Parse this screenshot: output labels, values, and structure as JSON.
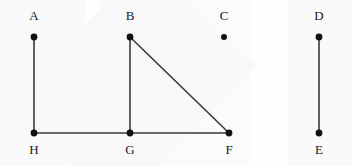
{
  "figure": {
    "kind": "undirected-graph-diagram",
    "width": 352,
    "height": 166,
    "background_color": "#fdfdfd",
    "edge_color": "#3a3a3a",
    "vertex_color": "#111111",
    "label_color": "#1a1a1a"
  },
  "vertices": [
    {
      "id": "A",
      "label": "A",
      "x": 34,
      "y": 37,
      "label_x": 24,
      "label_y": 9,
      "label_position": "above",
      "degree": 1,
      "radius": 3.4
    },
    {
      "id": "B",
      "label": "B",
      "x": 130,
      "y": 37,
      "label_x": 120,
      "label_y": 9,
      "label_position": "above",
      "degree": 2,
      "radius": 3.4
    },
    {
      "id": "C",
      "label": "C",
      "x": 224,
      "y": 37,
      "label_x": 214,
      "label_y": 9,
      "label_position": "above",
      "degree": 0,
      "radius": 3.0
    },
    {
      "id": "D",
      "label": "D",
      "x": 319,
      "y": 37,
      "label_x": 309,
      "label_y": 9,
      "label_position": "above",
      "degree": 1,
      "radius": 3.4
    },
    {
      "id": "E",
      "label": "E",
      "x": 319,
      "y": 133,
      "label_x": 309,
      "label_y": 143,
      "label_position": "below",
      "degree": 1,
      "radius": 3.4
    },
    {
      "id": "F",
      "label": "F",
      "x": 229,
      "y": 133,
      "label_x": 219,
      "label_y": 143,
      "label_position": "below",
      "degree": 2,
      "radius": 3.4
    },
    {
      "id": "G",
      "label": "G",
      "x": 130,
      "y": 133,
      "label_x": 120,
      "label_y": 143,
      "label_position": "below",
      "degree": 3,
      "radius": 3.4
    },
    {
      "id": "H",
      "label": "H",
      "x": 34,
      "y": 133,
      "label_x": 24,
      "label_y": 143,
      "label_position": "below",
      "degree": 2,
      "radius": 3.4
    }
  ],
  "edges": [
    {
      "id": "A-H",
      "from": "A",
      "to": "H",
      "x1": 34,
      "y1": 37,
      "x2": 34,
      "y2": 133,
      "orientation": "vertical"
    },
    {
      "id": "B-G",
      "from": "B",
      "to": "G",
      "x1": 130,
      "y1": 37,
      "x2": 130,
      "y2": 133,
      "orientation": "vertical"
    },
    {
      "id": "B-F",
      "from": "B",
      "to": "F",
      "x1": 130,
      "y1": 37,
      "x2": 229,
      "y2": 133,
      "orientation": "diagonal"
    },
    {
      "id": "G-F",
      "from": "G",
      "to": "F",
      "x1": 130,
      "y1": 133,
      "x2": 229,
      "y2": 133,
      "orientation": "horizontal"
    },
    {
      "id": "H-G",
      "from": "H",
      "to": "G",
      "x1": 34,
      "y1": 133,
      "x2": 130,
      "y2": 133,
      "orientation": "horizontal"
    },
    {
      "id": "D-E",
      "from": "D",
      "to": "E",
      "x1": 319,
      "y1": 37,
      "x2": 319,
      "y2": 133,
      "orientation": "vertical"
    }
  ]
}
